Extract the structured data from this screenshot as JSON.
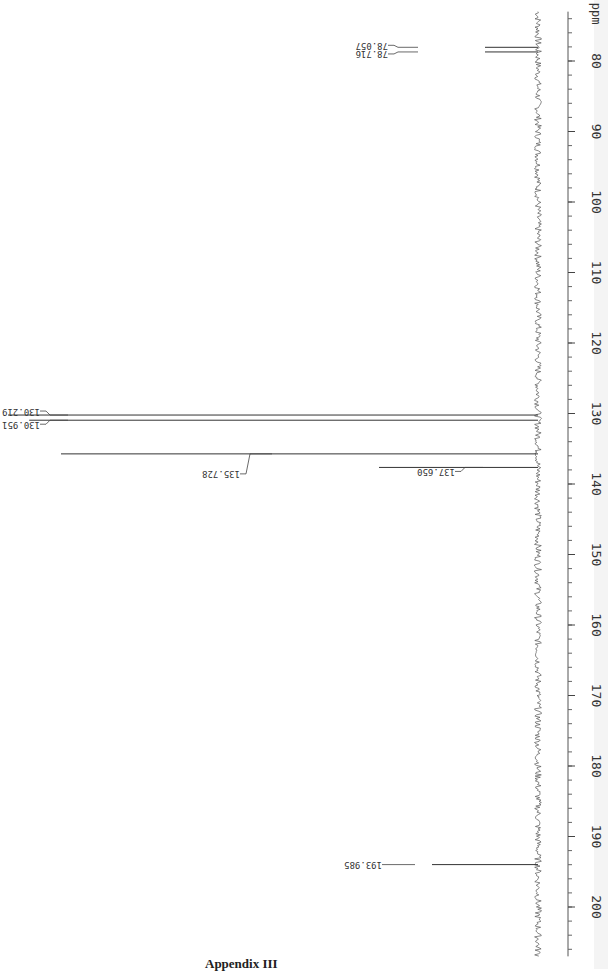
{
  "chart_data": {
    "type": "line",
    "xlabel": "ppm",
    "orientation": "rotated 90° (ppm axis vertical, increasing downward)",
    "axis": {
      "unit_label": "ppm",
      "range": [
        73,
        207
      ],
      "major_ticks": [
        80,
        90,
        100,
        110,
        120,
        130,
        140,
        150,
        160,
        170,
        180,
        190,
        200
      ],
      "minor_tick_step": 2
    },
    "peaks": [
      {
        "ppm": 78.057,
        "label": "78.057",
        "relative_intensity": 0.1
      },
      {
        "ppm": 78.716,
        "label": "78.716",
        "relative_intensity": 0.1
      },
      {
        "ppm": 130.219,
        "label": "130.219",
        "relative_intensity": 1.0
      },
      {
        "ppm": 130.951,
        "label": "130.951",
        "relative_intensity": 0.96
      },
      {
        "ppm": 135.728,
        "label": "135.728",
        "relative_intensity": 0.9
      },
      {
        "ppm": 137.65,
        "label": "137.650",
        "relative_intensity": 0.3
      },
      {
        "ppm": 193.985,
        "label": "193.985",
        "relative_intensity": 0.2
      }
    ],
    "grid": false,
    "legend": null
  },
  "caption": "Appendix III"
}
